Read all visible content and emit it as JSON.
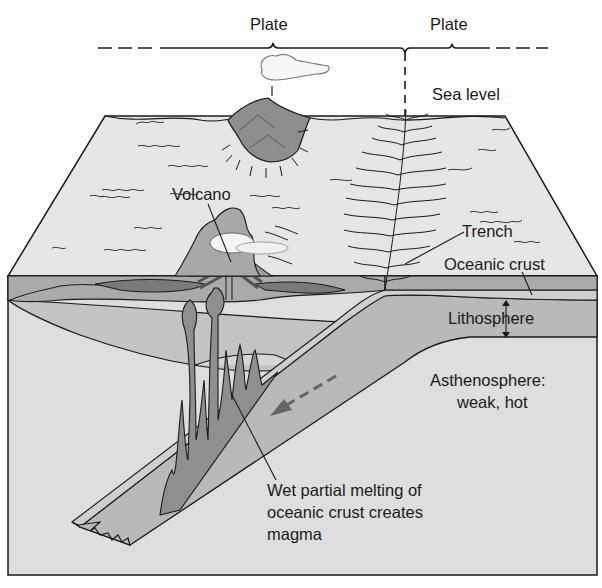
{
  "diagram": {
    "type": "cross-section",
    "labels": {
      "plate_left": "Plate",
      "plate_right": "Plate",
      "sea_level": "Sea level",
      "volcano": "Volcano",
      "trench": "Trench",
      "oceanic_crust": "Oceanic crust",
      "lithosphere": "Lithosphere",
      "asthenosphere_line1": "Asthenosphere:",
      "asthenosphere_line2": "weak, hot",
      "melting_line1": "Wet partial melting of",
      "melting_line2": "oceanic crust creates",
      "melting_line3": "magma"
    },
    "colors": {
      "background": "#ffffff",
      "sea_surface": "#e6e6e6",
      "crust_band": "#a9a9a9",
      "lithosphere": "#b9b9b9",
      "mantle_wedge": "#c8c8c8",
      "asthenosphere": "#dedede",
      "magma": "#8f8f8f",
      "dark_sediment": "#7a7a7a",
      "outline": "#1a1a1a"
    }
  }
}
